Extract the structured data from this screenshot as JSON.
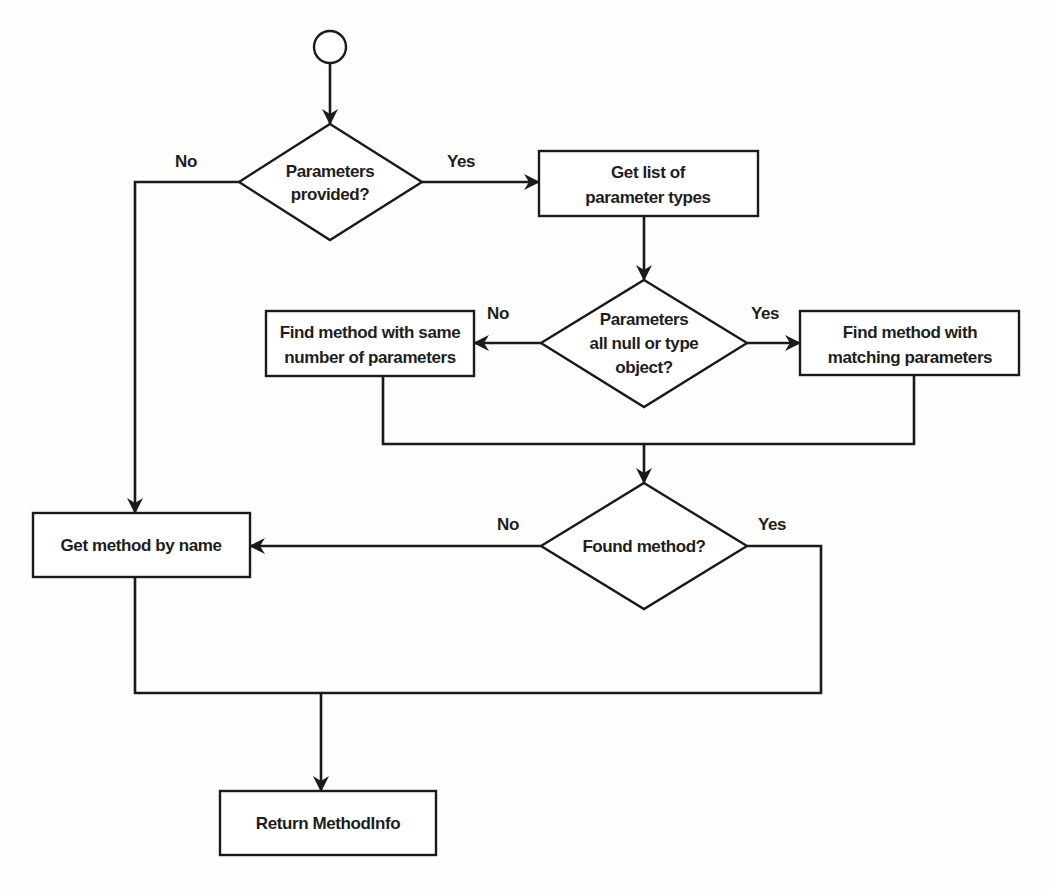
{
  "diagram": {
    "type": "flowchart",
    "start": {
      "label": ""
    },
    "nodes": {
      "params_provided": {
        "kind": "decision",
        "lines": [
          "Parameters",
          "provided?"
        ]
      },
      "get_param_types": {
        "kind": "process",
        "lines": [
          "Get list of",
          "parameter types"
        ]
      },
      "params_null_object": {
        "kind": "decision",
        "lines": [
          "Parameters",
          "all null or type",
          "object?"
        ]
      },
      "find_same_count": {
        "kind": "process",
        "lines": [
          "Find method with same",
          "number of parameters"
        ]
      },
      "find_matching": {
        "kind": "process",
        "lines": [
          "Find method with",
          "matching parameters"
        ]
      },
      "found_method": {
        "kind": "decision",
        "lines": [
          "Found method?"
        ]
      },
      "get_by_name": {
        "kind": "process",
        "lines": [
          "Get method by name"
        ]
      },
      "return_info": {
        "kind": "process",
        "lines": [
          "Return MethodInfo"
        ]
      }
    },
    "edges": {
      "params_provided_no": "No",
      "params_provided_yes": "Yes",
      "params_null_object_no": "No",
      "params_null_object_yes": "Yes",
      "found_method_no": "No",
      "found_method_yes": "Yes"
    },
    "colors": {
      "stroke": "#1a1a1a",
      "fill": "#ffffff",
      "background": "#fdfdfb"
    }
  }
}
